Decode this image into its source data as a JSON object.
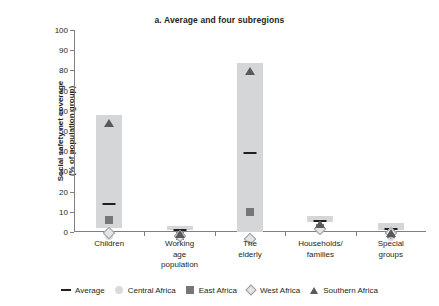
{
  "chart_data": {
    "type": "bar",
    "title": "a. Average and four subregions",
    "xlabel": "",
    "ylabel": "Social safety net coverage\n(% of population group)",
    "ylabel_line1": "Social safety net coverage",
    "ylabel_line2": "(% of population group)",
    "ylim": [
      0,
      100
    ],
    "yticks": [
      0,
      10,
      20,
      30,
      40,
      50,
      60,
      70,
      80,
      90,
      100
    ],
    "grid": false,
    "legend_position": "bottom",
    "categories": [
      "Children",
      "Working age population",
      "The elderly",
      "Households/ families",
      "Special groups"
    ],
    "category_labels": [
      "Children",
      "Working age\npopulation",
      "The elderly",
      "Households/\nfamilies",
      "Special groups"
    ],
    "bar_ranges": [
      {
        "bottom": 2,
        "top": 58
      },
      {
        "bottom": 1,
        "top": 3
      },
      {
        "bottom": 0,
        "top": 83.5
      },
      {
        "bottom": 5,
        "top": 8
      },
      {
        "bottom": 1,
        "top": 4.5
      }
    ],
    "series": [
      {
        "name": "Average",
        "marker": "dash",
        "color": "#231f20",
        "values": [
          15,
          2,
          40,
          6.5,
          2.5
        ]
      },
      {
        "name": "Central Africa",
        "marker": "circle",
        "color": "#d9dadb",
        "values": [
          2,
          1.5,
          0.5,
          5,
          1.5
        ]
      },
      {
        "name": "East Africa",
        "marker": "square",
        "color": "#74767a",
        "values": [
          10,
          2,
          14,
          6,
          3
        ]
      },
      {
        "name": "West Africa",
        "marker": "diamond",
        "color": "#e3e4e5",
        "values": [
          4,
          2.5,
          1,
          6,
          4
        ]
      },
      {
        "name": "Southern Africa",
        "marker": "triangle",
        "color": "#58595b",
        "values": [
          58,
          3,
          83.5,
          8,
          3.5
        ]
      }
    ],
    "legend": [
      {
        "label": "Average",
        "marker": "dash"
      },
      {
        "label": "Central Africa",
        "marker": "circle"
      },
      {
        "label": "East Africa",
        "marker": "square"
      },
      {
        "label": "West Africa",
        "marker": "diamond"
      },
      {
        "label": "Southern Africa",
        "marker": "triangle"
      }
    ],
    "colors": {
      "bar_fill": "#d5d6d8",
      "axis": "#7f7f7f",
      "text": "#231f20"
    }
  }
}
